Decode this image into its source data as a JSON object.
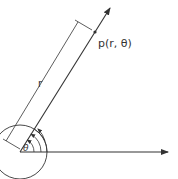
{
  "diagram": {
    "point_label": "p(r, θ)",
    "radius_label": "r",
    "angle_label": "θ",
    "colors": {
      "stroke": "#333333",
      "background": "#ffffff"
    }
  }
}
